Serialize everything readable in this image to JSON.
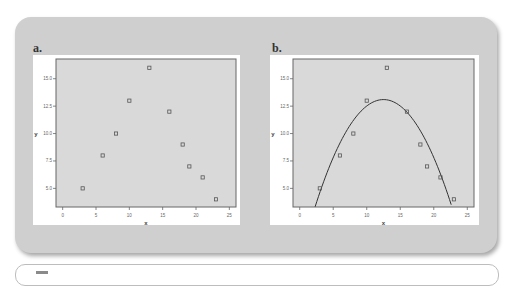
{
  "panels": [
    {
      "label": "a.",
      "xlabel": "x",
      "ylabel": "y",
      "xticks": [
        "0",
        "5",
        "10",
        "15",
        "20",
        "25"
      ],
      "yticks": [
        "5.0",
        "7.5",
        "10.0",
        "12.5",
        "15.0"
      ],
      "has_fit_curve": false
    },
    {
      "label": "b.",
      "xlabel": "x",
      "ylabel": "y",
      "xticks": [
        "0",
        "5",
        "10",
        "15",
        "20",
        "25"
      ],
      "yticks": [
        "5.0",
        "7.5",
        "10.0",
        "12.5",
        "15.0"
      ],
      "has_fit_curve": true
    }
  ],
  "caption": {
    "text": ""
  },
  "colors": {
    "outer_panel": "#cfcfcf",
    "plot_bg": "#d9d9d9",
    "marker": "#555555",
    "curve": "#333333"
  },
  "chart_data": [
    {
      "type": "scatter",
      "title": "a.",
      "xlabel": "x",
      "ylabel": "y",
      "xlim": [
        -1,
        26
      ],
      "ylim": [
        3.3,
        16.8
      ],
      "xticks": [
        0,
        5,
        10,
        15,
        20,
        25
      ],
      "yticks": [
        5.0,
        7.5,
        10.0,
        12.5,
        15.0
      ],
      "grid": false,
      "x": [
        3,
        6,
        8,
        10,
        13,
        16,
        18,
        19,
        21,
        23
      ],
      "y": [
        5.0,
        8.0,
        10.0,
        13.0,
        16.0,
        12.0,
        9.0,
        7.0,
        6.0,
        4.0
      ]
    },
    {
      "type": "scatter",
      "title": "b.",
      "xlabel": "x",
      "ylabel": "y",
      "xlim": [
        -1,
        26
      ],
      "ylim": [
        3.3,
        16.8
      ],
      "xticks": [
        0,
        5,
        10,
        15,
        20,
        25
      ],
      "yticks": [
        5.0,
        7.5,
        10.0,
        12.5,
        15.0
      ],
      "grid": false,
      "x": [
        3,
        6,
        8,
        10,
        13,
        16,
        18,
        19,
        21,
        23
      ],
      "y": [
        5.0,
        8.0,
        10.0,
        13.0,
        16.0,
        12.0,
        9.0,
        7.0,
        6.0,
        4.0
      ],
      "fit": {
        "type": "quadratic",
        "vertex_x": 12.5,
        "vertex_y": 13.1,
        "a": -0.094,
        "x_range": [
          2.3,
          22.6
        ]
      }
    }
  ]
}
